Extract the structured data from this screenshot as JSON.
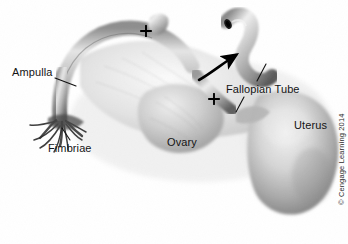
{
  "figure": {
    "kind": "anatomical-photograph",
    "background_color": "#ffffff",
    "specimen_tone": "grayscale",
    "width": 348,
    "height": 244
  },
  "labels": [
    {
      "id": "ampulla",
      "text": "Ampulla",
      "x": 12,
      "y": 66,
      "align": "left"
    },
    {
      "id": "fimbriae",
      "text": "Fimbriae",
      "x": 48,
      "y": 142,
      "align": "left"
    },
    {
      "id": "ovary",
      "text": "Ovary",
      "x": 167,
      "y": 136,
      "align": "left"
    },
    {
      "id": "fallopian-tube",
      "text": "Fallopian Tube",
      "x": 226,
      "y": 83,
      "align": "left"
    },
    {
      "id": "uterus",
      "text": "Uterus",
      "x": 294,
      "y": 119,
      "align": "left"
    }
  ],
  "markers": {
    "cross_upper": {
      "label": "+",
      "x": 145,
      "y": 30
    },
    "cross_lower": {
      "label": "+",
      "x": 213,
      "y": 98
    },
    "curved_arrow": {
      "description": "curved arrow pointing up-right toward excised tube segment"
    }
  },
  "copyright": {
    "text": "© Cengage Learning 2014",
    "x": 338,
    "y": 205,
    "rotation_deg": -90
  }
}
